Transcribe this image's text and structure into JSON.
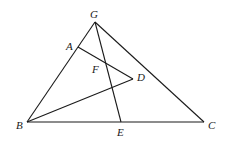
{
  "diagram": {
    "type": "geometry-figure",
    "points": {
      "G": {
        "label": "G",
        "x": 95,
        "y": 22
      },
      "A": {
        "label": "A",
        "x": 78,
        "y": 47
      },
      "F": {
        "label": "F",
        "x": 105,
        "y": 63
      },
      "D": {
        "label": "D",
        "x": 133,
        "y": 79
      },
      "B": {
        "label": "B",
        "x": 27,
        "y": 122
      },
      "E": {
        "label": "E",
        "x": 121,
        "y": 122
      },
      "C": {
        "label": "C",
        "x": 204,
        "y": 122
      }
    },
    "segments": [
      "GB",
      "GC",
      "BC",
      "AD",
      "GE",
      "BD"
    ]
  }
}
